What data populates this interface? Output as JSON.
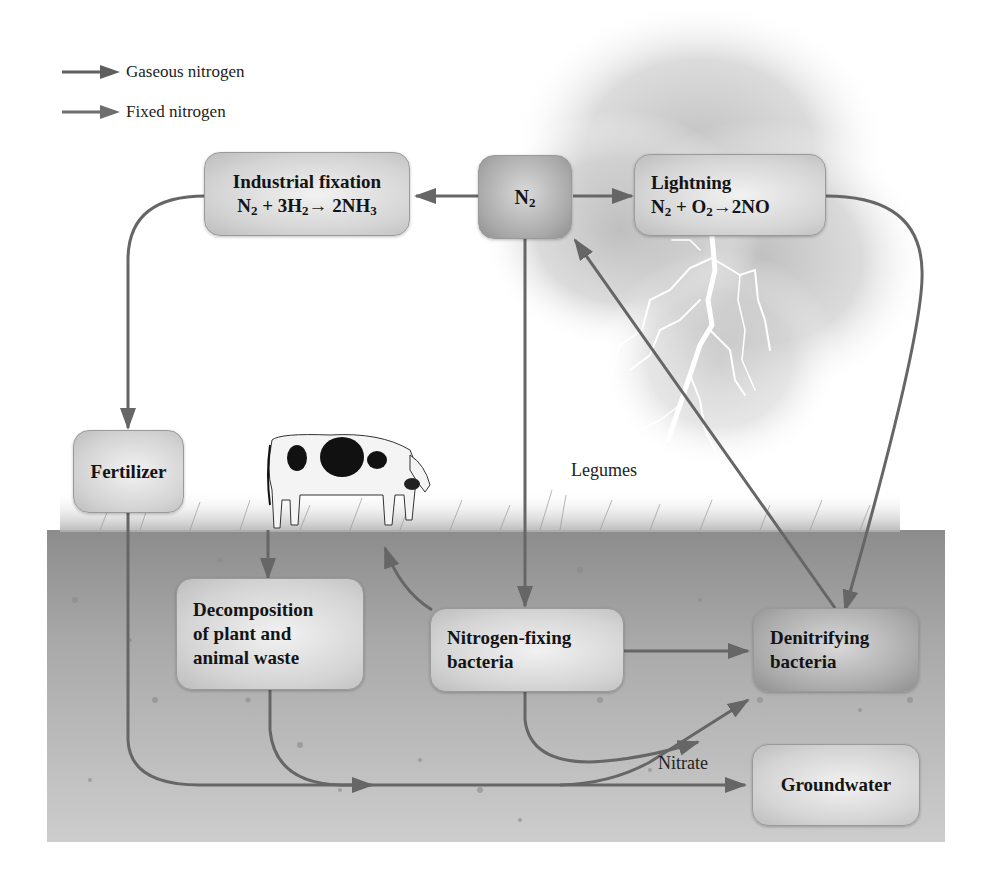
{
  "legend": {
    "items": [
      {
        "label": "Gaseous nitrogen",
        "kind": "gaseous",
        "color": "#5f5f5f"
      },
      {
        "label": "Fixed nitrogen",
        "kind": "fixed",
        "color": "#6e6e6e"
      }
    ]
  },
  "nodes": {
    "n2": {
      "title": "N",
      "sub": "2"
    },
    "industrial": {
      "title": "Industrial fixation",
      "eq": {
        "a": "N",
        "a_sub": "2",
        "plus": " + 3H",
        "b_sub": "2",
        "arrow": "→",
        "prod": " 2NH",
        "prod_sub": "3"
      }
    },
    "lightning": {
      "title": "Lightning",
      "eq": {
        "a": "N",
        "a_sub": "2",
        "plus": " + O",
        "b_sub": "2",
        "arrow": "→",
        "prod": "2NO"
      }
    },
    "fertilizer": {
      "title": "Fertilizer"
    },
    "decomposition": {
      "line1": "Decomposition",
      "line2": "of plant and",
      "line3": "animal waste"
    },
    "nitrogen_fixing": {
      "line1": "Nitrogen-fixing",
      "line2": "bacteria"
    },
    "denitrifying": {
      "line1": "Denitrifying",
      "line2": "bacteria"
    },
    "groundwater": {
      "title": "Groundwater"
    }
  },
  "labels": {
    "legumes": "Legumes",
    "nitrate": "Nitrate"
  },
  "colors": {
    "arrow": "#666666",
    "soil_top": "#8e8e8e",
    "soil_bottom": "#c9c9c9",
    "node_light": "#d4d4d4",
    "node_dark": "#a9a9a9"
  }
}
